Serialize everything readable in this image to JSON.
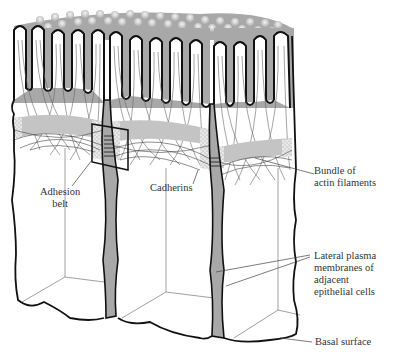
{
  "diagram": {
    "colors": {
      "background": "#ffffff",
      "cytoplasm_fill": "#a8a8a8",
      "microvilli_fill": "#ffffff",
      "outline": "#111111",
      "filament": "#555555",
      "belt_fill": "#c8c8c8",
      "stipple": "#bbbbbb"
    },
    "labels": {
      "adhesion_belt": [
        "Adhesion",
        "belt"
      ],
      "cadherins": "Cadherins",
      "actin_bundle": [
        "Bundle of",
        "actin filaments"
      ],
      "lateral_membranes": [
        "Lateral plasma",
        "membranes of",
        "adjacent",
        "epithelial cells"
      ],
      "basal_surface": "Basal surface"
    }
  }
}
